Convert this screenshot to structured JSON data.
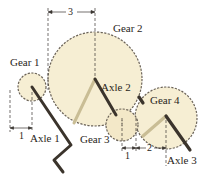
{
  "labels": {
    "gear1": "Gear 1",
    "gear2": "Gear 2",
    "gear3": "Gear 3",
    "gear4": "Gear 4",
    "axle1": "Axle 1",
    "axle2": "Axle 2",
    "axle3": "Axle 3"
  },
  "dimensions": {
    "gear2_radius": "3",
    "gear1_radius": "1",
    "gear3_radius": "1",
    "gear4_radius": "2"
  },
  "colors": {
    "gear_fill": "#f6eed3",
    "gear_outline": "#6b6358",
    "rod_dark": "#3b342c",
    "rod_light": "#c9bd95",
    "dash": "#3a3530",
    "text": "#2a2520"
  }
}
